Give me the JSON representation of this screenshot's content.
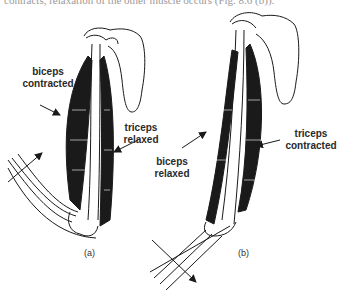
{
  "caption_fragment": "contracts, relaxation of the other muscle occurs (Fig. 8.6 (b)).",
  "panels": [
    {
      "id": "a",
      "panel_label": "(a)",
      "labels": {
        "biceps": [
          "biceps",
          "contracted"
        ],
        "triceps": [
          "triceps",
          "relaxed"
        ]
      },
      "state": "arm bent (flexion)"
    },
    {
      "id": "b",
      "panel_label": "(b)",
      "labels": {
        "biceps": [
          "biceps",
          "relaxed"
        ],
        "triceps": [
          "triceps",
          "contracted"
        ]
      },
      "state": "arm straightened (extension)"
    }
  ],
  "colors": {
    "ink": "#1a1a1a",
    "background": "#ffffff"
  }
}
